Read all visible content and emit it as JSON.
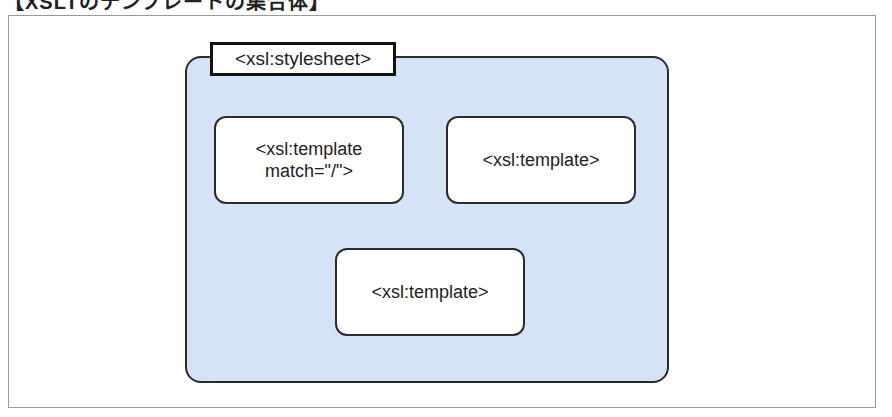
{
  "title": "【XSLTのテンプレートの集合体】",
  "diagram": {
    "container": {
      "label": "<xsl:stylesheet>",
      "fill_color": "#d4e3f5",
      "border_color": "#2b2b2b"
    },
    "nodes": [
      {
        "lines": [
          "<xsl:template",
          "match=\"/\">"
        ]
      },
      {
        "lines": [
          "<xsl:template>"
        ]
      },
      {
        "lines": [
          "<xsl:template>"
        ]
      }
    ]
  }
}
